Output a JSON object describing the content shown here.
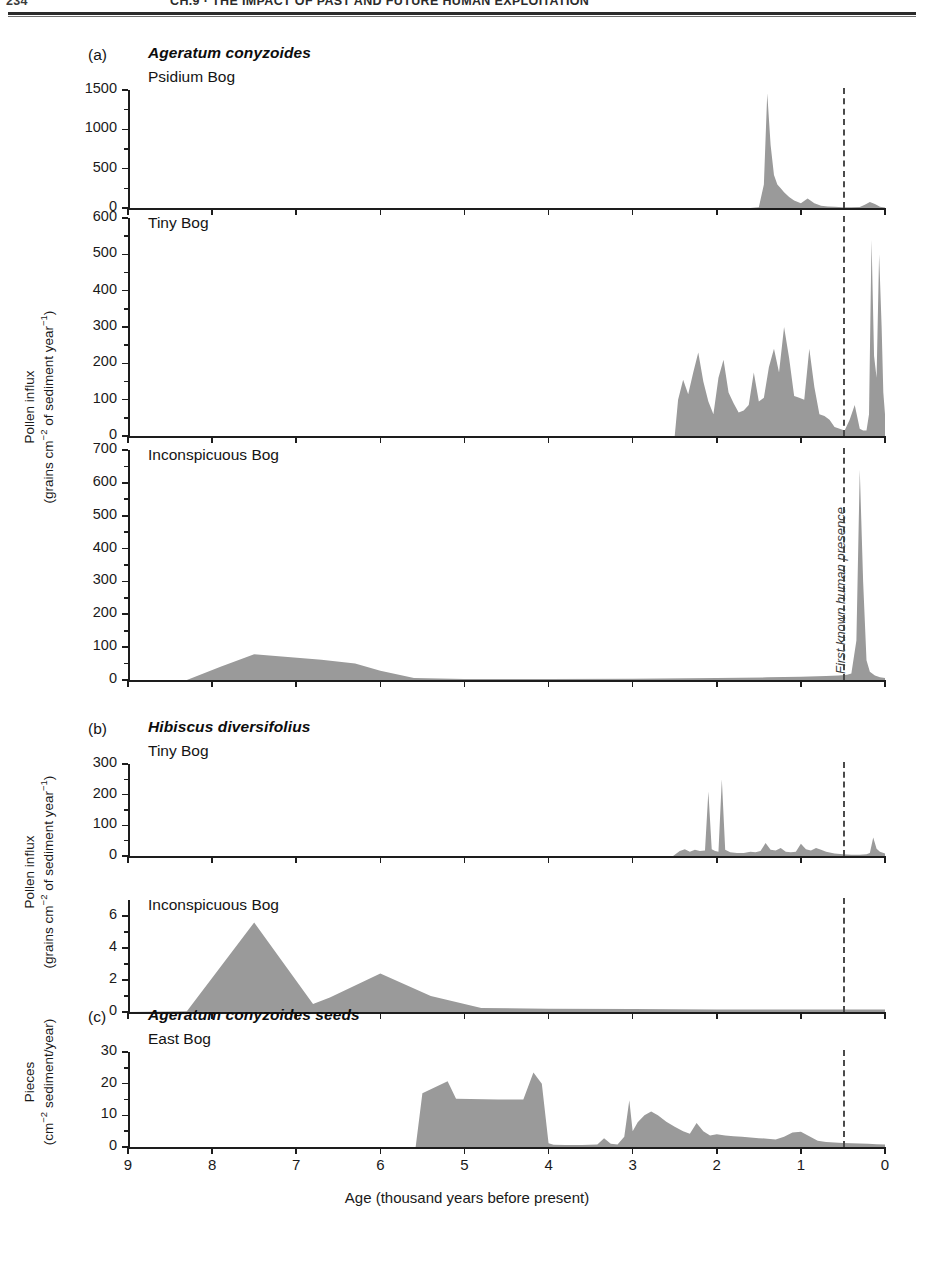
{
  "running_head": {
    "folio": "234",
    "title": "CH.9 · THE IMPACT OF PAST AND FUTURE HUMAN EXPLOITATION"
  },
  "figure": {
    "x_axis": {
      "title": "Age (thousand years before present)",
      "ticks": [
        "9",
        "8",
        "7",
        "6",
        "5",
        "4",
        "3",
        "2",
        "1",
        "0"
      ],
      "min": 0,
      "max": 9,
      "reversed": true
    },
    "annotation": {
      "label": "First known human presence",
      "age_ka": 0.5,
      "style": "dashed-vertical-line"
    },
    "colors": {
      "fill": "#9a9a9a",
      "axis": "#1d1d1d",
      "annotation": "#4a4a4a"
    },
    "groups": [
      {
        "letter": "(a)",
        "species": "Ageratum conyzoides",
        "axis_title_line1": "Pollen influx",
        "axis_title_line2": "(grains cm−2 of sediment year−1)",
        "panels": [
          {
            "site": "Psidium Bog",
            "y_ticks": [
              "0",
              "500",
              "1000",
              "1500"
            ],
            "y_max": 1500
          },
          {
            "site": "Tiny Bog",
            "y_ticks": [
              "0",
              "100",
              "200",
              "300",
              "400",
              "500",
              "600"
            ],
            "y_max": 600
          },
          {
            "site": "Inconspicuous Bog",
            "y_ticks": [
              "0",
              "100",
              "200",
              "300",
              "400",
              "500",
              "600",
              "700"
            ],
            "y_max": 700
          }
        ]
      },
      {
        "letter": "(b)",
        "species": "Hibiscus diversifolius",
        "axis_title_line1": "Pollen influx",
        "axis_title_line2": "(grains cm−2 of sediment year−1)",
        "panels": [
          {
            "site": "Tiny Bog",
            "y_ticks": [
              "0",
              "100",
              "200",
              "300"
            ],
            "y_max": 300
          },
          {
            "site": "Inconspicuous Bog",
            "y_ticks": [
              "0",
              "2",
              "4",
              "6"
            ],
            "y_max": 7
          }
        ]
      },
      {
        "letter": "(c)",
        "species": "Ageratum conyzoides seeds",
        "axis_title_line1": "Pieces",
        "axis_title_line2": "(cm−2 sediment/year)",
        "panels": [
          {
            "site": "East Bog",
            "y_ticks": [
              "0",
              "10",
              "20",
              "30"
            ],
            "y_max": 30
          }
        ]
      }
    ]
  },
  "chart_data": {
    "type": "area",
    "xlabel": "Age (thousand years before present)",
    "xlim": [
      9,
      0
    ],
    "x_reversed": true,
    "grid": false,
    "legend": "none",
    "annotations": [
      {
        "text": "First known human presence",
        "x": 0.5,
        "type": "vline",
        "style": "dashed"
      }
    ],
    "panels": [
      {
        "id": "a1",
        "group": "(a) Ageratum conyzoides",
        "site": "Psidium Bog",
        "ylabel": "Pollen influx (grains cm-2 of sediment year-1)",
        "ylim": [
          0,
          1500
        ],
        "yticks": [
          0,
          500,
          1000,
          1500
        ],
        "x": [
          9.0,
          1.6,
          1.5,
          1.44,
          1.4,
          1.36,
          1.32,
          1.28,
          1.24,
          1.2,
          1.14,
          1.08,
          1.0,
          0.92,
          0.84,
          0.76,
          0.68,
          0.6,
          0.5,
          0.4,
          0.3,
          0.24,
          0.18,
          0.12,
          0.06,
          0.0
        ],
        "y": [
          0,
          0,
          10,
          300,
          1460,
          800,
          420,
          300,
          250,
          200,
          140,
          95,
          60,
          120,
          60,
          30,
          20,
          15,
          10,
          10,
          12,
          40,
          75,
          50,
          15,
          5
        ]
      },
      {
        "id": "a2",
        "group": "(a) Ageratum conyzoides",
        "site": "Tiny Bog",
        "ylabel": "Pollen influx (grains cm-2 of sediment year-1)",
        "ylim": [
          0,
          600
        ],
        "yticks": [
          0,
          100,
          200,
          300,
          400,
          500,
          600
        ],
        "x": [
          9.0,
          2.5,
          2.46,
          2.4,
          2.34,
          2.28,
          2.22,
          2.16,
          2.1,
          2.04,
          1.98,
          1.92,
          1.86,
          1.8,
          1.74,
          1.68,
          1.62,
          1.56,
          1.5,
          1.44,
          1.38,
          1.32,
          1.26,
          1.2,
          1.14,
          1.08,
          1.02,
          0.96,
          0.9,
          0.84,
          0.78,
          0.72,
          0.66,
          0.6,
          0.54,
          0.48,
          0.42,
          0.36,
          0.3,
          0.26,
          0.22,
          0.19,
          0.16,
          0.13,
          0.1,
          0.07,
          0.04,
          0.02,
          0.0
        ],
        "y": [
          0,
          0,
          100,
          155,
          115,
          175,
          230,
          150,
          95,
          60,
          160,
          210,
          120,
          90,
          65,
          70,
          85,
          175,
          95,
          105,
          190,
          240,
          175,
          300,
          215,
          110,
          105,
          100,
          240,
          135,
          60,
          55,
          45,
          25,
          20,
          15,
          45,
          85,
          20,
          15,
          15,
          60,
          540,
          220,
          160,
          500,
          300,
          120,
          60
        ]
      },
      {
        "id": "a3",
        "group": "(a) Ageratum conyzoides",
        "site": "Inconspicuous Bog",
        "ylabel": "Pollen influx (grains cm-2 of sediment year-1)",
        "ylim": [
          0,
          700
        ],
        "yticks": [
          0,
          100,
          200,
          300,
          400,
          500,
          600,
          700
        ],
        "x": [
          9.0,
          8.3,
          7.9,
          7.5,
          7.1,
          6.7,
          6.3,
          6.0,
          5.6,
          5.0,
          4.0,
          3.0,
          2.0,
          1.4,
          1.0,
          0.7,
          0.55,
          0.45,
          0.4,
          0.34,
          0.3,
          0.26,
          0.22,
          0.18,
          0.12,
          0.06,
          0.0
        ],
        "y": [
          0,
          0,
          40,
          78,
          70,
          62,
          50,
          28,
          6,
          3,
          3,
          4,
          6,
          8,
          10,
          12,
          14,
          16,
          20,
          120,
          640,
          300,
          60,
          25,
          14,
          8,
          6
        ]
      },
      {
        "id": "b1",
        "group": "(b) Hibiscus diversifolius",
        "site": "Tiny Bog",
        "ylabel": "Pollen influx (grains cm-2 of sediment year-1)",
        "ylim": [
          0,
          300
        ],
        "yticks": [
          0,
          100,
          200,
          300
        ],
        "x": [
          9.0,
          2.52,
          2.44,
          2.38,
          2.32,
          2.26,
          2.2,
          2.14,
          2.1,
          2.06,
          2.02,
          1.98,
          1.94,
          1.9,
          1.84,
          1.76,
          1.68,
          1.6,
          1.54,
          1.48,
          1.42,
          1.36,
          1.3,
          1.24,
          1.18,
          1.12,
          1.06,
          1.0,
          0.94,
          0.88,
          0.82,
          0.76,
          0.7,
          0.6,
          0.5,
          0.4,
          0.3,
          0.22,
          0.18,
          0.14,
          0.1,
          0.06,
          0.0
        ],
        "y": [
          0,
          0,
          16,
          22,
          14,
          20,
          16,
          18,
          210,
          22,
          16,
          14,
          250,
          20,
          12,
          10,
          10,
          14,
          12,
          16,
          42,
          20,
          18,
          26,
          14,
          12,
          14,
          40,
          22,
          18,
          26,
          20,
          14,
          8,
          6,
          4,
          4,
          6,
          10,
          60,
          24,
          14,
          8
        ]
      },
      {
        "id": "b2",
        "group": "(b) Hibiscus diversifolius",
        "site": "Inconspicuous Bog",
        "ylabel": "Pollen influx (grains cm-2 of sediment year-1)",
        "ylim": [
          0,
          7
        ],
        "yticks": [
          0,
          2,
          4,
          6
        ],
        "x": [
          9.0,
          8.3,
          7.5,
          6.8,
          6.6,
          6.0,
          5.4,
          4.8,
          4.0,
          3.0,
          2.0,
          1.0,
          0.5,
          0.25,
          0.0
        ],
        "y": [
          0,
          0.05,
          5.6,
          0.5,
          0.9,
          2.4,
          1.0,
          0.25,
          0.2,
          0.18,
          0.16,
          0.15,
          0.15,
          0.15,
          0.15
        ]
      },
      {
        "id": "c1",
        "group": "(c) Ageratum conyzoides seeds",
        "site": "East Bog",
        "ylabel": "Pieces (cm-2 sediment/year)",
        "ylim": [
          0,
          30
        ],
        "yticks": [
          0,
          10,
          20,
          30
        ],
        "x": [
          9.0,
          5.58,
          5.5,
          5.2,
          5.1,
          4.6,
          4.3,
          4.18,
          4.08,
          4.0,
          3.94,
          3.8,
          3.6,
          3.42,
          3.34,
          3.26,
          3.18,
          3.1,
          3.04,
          3.0,
          2.94,
          2.86,
          2.78,
          2.7,
          2.6,
          2.5,
          2.4,
          2.32,
          2.24,
          2.16,
          2.08,
          2.0,
          1.9,
          1.8,
          1.7,
          1.6,
          1.5,
          1.4,
          1.3,
          1.2,
          1.1,
          1.0,
          0.9,
          0.8,
          0.7,
          0.6,
          0.5,
          0.4,
          0.3,
          0.2,
          0.1,
          0.0
        ],
        "y": [
          0,
          0,
          17,
          20.8,
          15.2,
          15.0,
          15.0,
          23.5,
          20.0,
          1.2,
          0.7,
          0.6,
          0.6,
          0.8,
          2.8,
          1.0,
          0.8,
          3.2,
          14.8,
          5.0,
          7.8,
          10.0,
          11.2,
          10.0,
          8.0,
          6.4,
          5.0,
          4.2,
          7.6,
          5.0,
          3.6,
          4.0,
          3.6,
          3.4,
          3.2,
          3.0,
          2.8,
          2.6,
          2.4,
          3.2,
          4.6,
          4.8,
          3.4,
          2.0,
          1.6,
          1.4,
          1.3,
          1.2,
          1.1,
          1.0,
          0.9,
          0.8
        ]
      }
    ]
  }
}
